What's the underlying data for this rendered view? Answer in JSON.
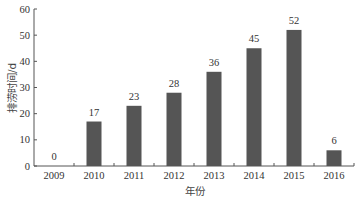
{
  "chart_data": {
    "type": "bar",
    "title": "",
    "xlabel": "年份",
    "ylabel": "排涝时间/d",
    "categories": [
      "2009",
      "2010",
      "2011",
      "2012",
      "2013",
      "2014",
      "2015",
      "2016"
    ],
    "values": [
      0,
      17,
      23,
      28,
      36,
      45,
      52,
      6
    ],
    "data_labels": [
      "0",
      "17",
      "23",
      "28",
      "36",
      "45",
      "52",
      "6"
    ],
    "ylim": [
      0,
      60
    ],
    "yticks": [
      0,
      10,
      20,
      30,
      40,
      50,
      60
    ],
    "grid": false,
    "legend": null,
    "bar_color": "#555555"
  }
}
